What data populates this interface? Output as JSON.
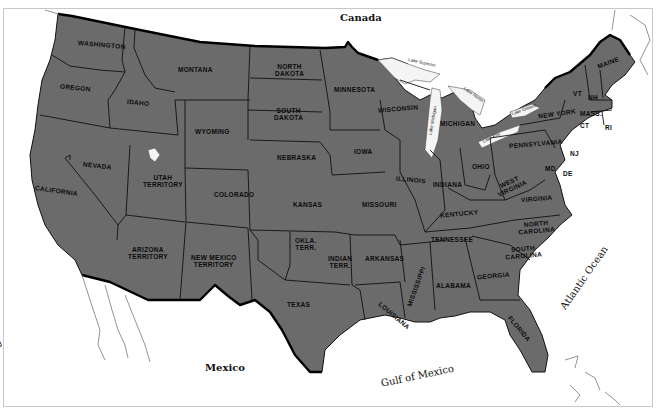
{
  "map": {
    "fill_color": "#6b6b6b",
    "background": "#ffffff",
    "regions": {
      "canada": "Canada",
      "mexico": "Mexico",
      "pacific_ocean": "Pacific Ocean",
      "atlantic_ocean": "Atlantic Ocean",
      "gulf_of_mexico": "Gulf of Mexico"
    },
    "lakes": {
      "superior": "Lake Superior",
      "michigan": "Lake Michigan",
      "huron": "Lake Huron",
      "erie": "Lake Erie",
      "ontario": "Lake Ontario"
    },
    "states": {
      "washington": "WASHINGTON",
      "oregon": "OREGON",
      "california": "CALIFORNIA",
      "nevada": "NEVADA",
      "idaho": "IDAHO",
      "montana": "MONTANA",
      "wyoming": "WYOMING",
      "utah": "UTAH\nTERRITORY",
      "arizona": "ARIZONA\nTERRITORY",
      "new_mexico": "NEW MEXICO\nTERRITORY",
      "colorado": "COLORADO",
      "north_dakota": "NORTH\nDAKOTA",
      "south_dakota": "SOUTH\nDAKOTA",
      "nebraska": "NEBRASKA",
      "kansas": "KANSAS",
      "okla_terr": "OKLA.\nTERR.",
      "indian_terr": "INDIAN\nTERR.",
      "texas": "TEXAS",
      "minnesota": "MINNESOTA",
      "iowa": "IOWA",
      "missouri": "MISSOURI",
      "arkansas": "ARKANSAS",
      "louisiana": "LOUISIANA",
      "wisconsin": "WISCONSIN",
      "illinois": "ILLINOIS",
      "michigan": "MICHIGAN",
      "indiana": "INDIANA",
      "ohio": "OHIO",
      "kentucky": "KENTUCKY",
      "tennessee": "TENNESSEE",
      "mississippi": "MISSISSIPPI",
      "alabama": "ALABAMA",
      "georgia": "GEORGIA",
      "florida": "FLORIDA",
      "south_carolina": "SOUTH\nCAROLINA",
      "north_carolina": "NORTH\nCAROLINA",
      "virginia": "VIRGINIA",
      "west_virginia": "WEST\nVIRGINIA",
      "maryland": "MD",
      "delaware": "DE",
      "new_jersey": "NJ",
      "pennsylvania": "PENNSYLVANIA",
      "new_york": "NEW YORK",
      "vermont": "VT",
      "new_hampshire": "NH",
      "maine": "MAINE",
      "massachusetts": "MASS.",
      "connecticut": "CT",
      "rhode_island": "RI"
    }
  }
}
